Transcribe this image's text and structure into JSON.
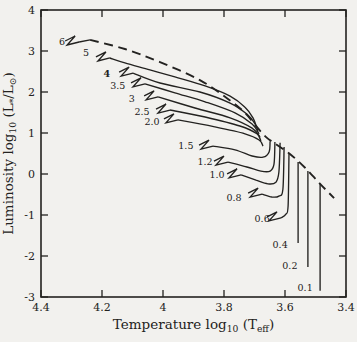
{
  "figure": {
    "background": "#f2f1ee",
    "ink": "#232220"
  },
  "chart_data": {
    "type": "line",
    "title": "",
    "xlabel": "Temperature log_{10} (T_{eff})",
    "ylabel": "Luminosity log_{10} (L_{*}/L_{⊙})",
    "xlim": [
      4.4,
      3.4
    ],
    "ylim": [
      -3,
      4
    ],
    "x_axis_reversed": true,
    "grid": false,
    "legend": "none",
    "xticks": {
      "values": [
        4.4,
        4.2,
        4.0,
        3.8,
        3.6,
        3.4
      ],
      "labels": [
        "4.4",
        "4.2",
        "4",
        "3.8",
        "3.6",
        "3.4"
      ]
    },
    "yticks": {
      "values": [
        -3,
        -2,
        -1,
        0,
        1,
        2,
        3,
        4
      ],
      "labels": [
        "-3",
        "-2",
        "-1",
        "0",
        "1",
        "2",
        "3",
        "4"
      ]
    },
    "birthline": {
      "name": "birthline",
      "style": "dashed",
      "points": [
        [
          4.239,
          3.27
        ],
        [
          4.125,
          3.05
        ],
        [
          4.01,
          2.73
        ],
        [
          3.879,
          2.29
        ],
        [
          3.787,
          1.83
        ],
        [
          3.731,
          1.49
        ],
        [
          3.695,
          1.17
        ],
        [
          3.662,
          0.9
        ],
        [
          3.63,
          0.73
        ],
        [
          3.584,
          0.49
        ],
        [
          3.534,
          0.15
        ],
        [
          3.485,
          -0.24
        ],
        [
          3.439,
          -0.59
        ]
      ]
    },
    "tracks": [
      {
        "mass": "6",
        "label_pos": [
          4.331,
          3.22
        ],
        "hook": true,
        "points": [
          [
            4.275,
            3.22
          ],
          [
            4.239,
            3.27
          ]
        ]
      },
      {
        "mass": "5",
        "label_pos": [
          4.252,
          2.95
        ],
        "hook": true,
        "points": [
          [
            4.174,
            2.83
          ],
          [
            4.125,
            2.71
          ],
          [
            4.043,
            2.54
          ],
          [
            3.961,
            2.37
          ],
          [
            3.862,
            2.15
          ],
          [
            3.78,
            1.9
          ],
          [
            3.731,
            1.63
          ],
          [
            3.705,
            1.37
          ],
          [
            3.692,
            1.12
          ]
        ]
      },
      {
        "mass": "4",
        "label_pos": [
          4.184,
          2.44
        ],
        "bold": true,
        "hook": true,
        "points": [
          [
            4.098,
            2.46
          ],
          [
            4.01,
            2.22
          ],
          [
            3.879,
            2.0
          ],
          [
            3.78,
            1.73
          ],
          [
            3.725,
            1.46
          ],
          [
            3.698,
            1.22
          ],
          [
            3.689,
            1.05
          ]
        ]
      },
      {
        "mass": "3.5",
        "label_pos": [
          4.148,
          2.15
        ],
        "hook": true,
        "points": [
          [
            4.059,
            2.2
          ],
          [
            3.961,
            1.98
          ],
          [
            3.862,
            1.76
          ],
          [
            3.764,
            1.49
          ],
          [
            3.708,
            1.22
          ],
          [
            3.685,
            0.98
          ]
        ]
      },
      {
        "mass": "3",
        "label_pos": [
          4.102,
          1.83
        ],
        "hook": true,
        "points": [
          [
            4.016,
            1.88
          ],
          [
            3.895,
            1.61
          ],
          [
            3.78,
            1.37
          ],
          [
            3.708,
            1.12
          ],
          [
            3.682,
            0.9
          ]
        ]
      },
      {
        "mass": "2.5",
        "label_pos": [
          4.069,
          1.51
        ],
        "hook": true,
        "points": [
          [
            3.977,
            1.56
          ],
          [
            3.862,
            1.39
          ],
          [
            3.748,
            1.17
          ],
          [
            3.692,
            0.98
          ],
          [
            3.679,
            0.8
          ]
        ]
      },
      {
        "mass": "2.0",
        "label_pos": [
          4.036,
          1.27
        ],
        "hook": true,
        "points": [
          [
            3.951,
            1.32
          ],
          [
            3.83,
            1.15
          ],
          [
            3.731,
            0.98
          ],
          [
            3.685,
            0.83
          ],
          [
            3.672,
            0.68
          ]
        ]
      },
      {
        "mass": "1.5",
        "label_pos": [
          3.925,
          0.68
        ],
        "hook": true,
        "points": [
          [
            3.836,
            0.68
          ],
          [
            3.764,
            0.59
          ],
          [
            3.708,
            0.44
          ],
          [
            3.672,
            0.41
          ],
          [
            3.652,
            0.54
          ],
          [
            3.649,
            0.8
          ]
        ]
      },
      {
        "mass": "1.2",
        "label_pos": [
          3.862,
          0.29
        ],
        "hook": true,
        "points": [
          [
            3.787,
            0.29
          ],
          [
            3.725,
            0.17
          ],
          [
            3.679,
            0.07
          ],
          [
            3.649,
            0.07
          ],
          [
            3.636,
            0.24
          ],
          [
            3.633,
            0.78
          ]
        ]
      },
      {
        "mass": "1.0",
        "label_pos": [
          3.823,
          -0.02
        ],
        "hook": true,
        "points": [
          [
            3.744,
            -0.02
          ],
          [
            3.695,
            -0.15
          ],
          [
            3.656,
            -0.24
          ],
          [
            3.63,
            -0.2
          ],
          [
            3.62,
            0.05
          ],
          [
            3.616,
            0.76
          ]
        ]
      },
      {
        "mass": "0.8",
        "label_pos": [
          3.767,
          -0.59
        ],
        "hook": true,
        "points": [
          [
            3.675,
            -0.49
          ],
          [
            3.643,
            -0.56
          ],
          [
            3.62,
            -0.54
          ],
          [
            3.607,
            -0.37
          ],
          [
            3.603,
            0.66
          ]
        ]
      },
      {
        "mass": "0.6",
        "label_pos": [
          3.675,
          -1.1
        ],
        "hook": true,
        "points": [
          [
            3.613,
            -1.07
          ],
          [
            3.597,
            -0.98
          ],
          [
            3.59,
            -0.78
          ],
          [
            3.587,
            0.49
          ]
        ]
      },
      {
        "mass": "0.4",
        "label_pos": [
          3.616,
          -1.73
        ],
        "hook": false,
        "points": [
          [
            3.557,
            -1.68
          ],
          [
            3.557,
            0.29
          ]
        ]
      },
      {
        "mass": "0.2",
        "label_pos": [
          3.584,
          -2.24
        ],
        "hook": false,
        "points": [
          [
            3.525,
            -2.27
          ],
          [
            3.525,
            0.07
          ]
        ]
      },
      {
        "mass": "0.1",
        "label_pos": [
          3.534,
          -2.78
        ],
        "hook": false,
        "points": [
          [
            3.485,
            -2.85
          ],
          [
            3.485,
            -0.24
          ]
        ]
      }
    ]
  }
}
